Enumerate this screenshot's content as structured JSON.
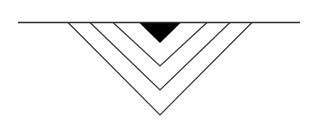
{
  "figure": {
    "background_color": "#ffffff",
    "canvas": {
      "width": 319,
      "height": 123
    },
    "line_color": "#332f2f",
    "fill_color": "#000000",
    "baseline": {
      "name": "horizontal-baseline",
      "x1": 18,
      "y1": 22.5,
      "x2": 300,
      "y2": 22.5,
      "stroke_width": 1.3
    },
    "apex_x": 160,
    "chevrons": [
      {
        "name": "chevron-outer",
        "index": 1,
        "style": "outline",
        "half_width": 92,
        "left_x": 68,
        "right_x": 252,
        "top_y": 22.5,
        "apex_y": 115,
        "stroke_width": 1.15,
        "fill": "none"
      },
      {
        "name": "chevron-second",
        "index": 2,
        "style": "outline",
        "half_width": 70,
        "left_x": 90,
        "right_x": 230,
        "top_y": 22.5,
        "apex_y": 90,
        "stroke_width": 1.15,
        "fill": "none"
      },
      {
        "name": "chevron-third",
        "index": 3,
        "style": "outline",
        "half_width": 47,
        "left_x": 113,
        "right_x": 207,
        "top_y": 22.5,
        "apex_y": 66,
        "stroke_width": 1.15,
        "fill": "none"
      },
      {
        "name": "chevron-inner-filled",
        "index": 4,
        "style": "filled",
        "half_width": 21,
        "left_x": 139,
        "right_x": 181,
        "top_y": 22.5,
        "apex_y": 43,
        "stroke_width": 0,
        "fill": "#000000"
      }
    ]
  }
}
